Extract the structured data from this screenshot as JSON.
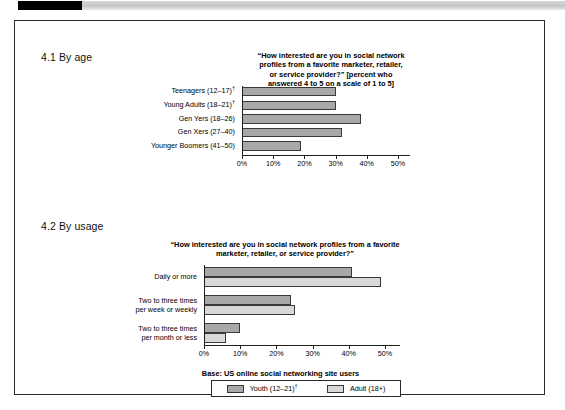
{
  "document": {
    "frame_border_color": "#2a2a2a",
    "tab_color": "#000000"
  },
  "sections": [
    {
      "id": "by-age",
      "heading": "4.1 By age"
    },
    {
      "id": "by-usage",
      "heading": "4.2 By usage"
    }
  ],
  "base_note": "Base: US online social networking site users",
  "legend": {
    "items": [
      {
        "label": "Youth (12–21)",
        "dagger": true,
        "color": "#a8a8a8"
      },
      {
        "label": "Adult (18+)",
        "dagger": false,
        "color": "#d8d8d8"
      }
    ]
  },
  "chart_data": [
    {
      "type": "bar",
      "orientation": "horizontal",
      "id": "by-age",
      "title": "“How interested are you in social network profiles from a favorite marketer, retailer, or service provider?” [percent who answered 4 to 5 on a scale of 1 to 5]",
      "title_lines": [
        "“How interested are you in social network",
        "profiles from a favorite marketer, retailer,",
        "or service provider?” [percent who",
        "answered 4 to 5 on a scale of 1 to 5]"
      ],
      "categories": [
        "Teenagers (12–17)",
        "Young Adults (18–21)",
        "Gen Yers (18–26)",
        "Gen Xers (27–40)",
        "Younger Boomers (41–50)"
      ],
      "category_daggers": [
        true,
        true,
        false,
        false,
        false
      ],
      "values": [
        30,
        30,
        38,
        32,
        19
      ],
      "series_colors": [
        "#a8a8a8",
        "#a8a8a8",
        "#a8a8a8",
        "#a8a8a8",
        "#a8a8a8"
      ],
      "xlabel": "",
      "ylabel": "",
      "xlim": [
        0,
        50
      ],
      "xticks": [
        0,
        10,
        20,
        30,
        40,
        50
      ],
      "xtick_labels": [
        "0%",
        "10%",
        "20%",
        "30%",
        "40%",
        "50%"
      ],
      "grid": false,
      "legend_position": "none"
    },
    {
      "type": "bar",
      "orientation": "horizontal",
      "id": "by-usage",
      "title": "“How interested are you in social network profiles from a favorite marketer, retailer, or service provider?”",
      "title_lines": [
        "“How interested are you in social network profiles from a favorite",
        "marketer, retailer, or service provider?”"
      ],
      "categories": [
        "Daily or more",
        "Two to three times per week or weekly",
        "Two to three times per month or less"
      ],
      "category_lines": [
        [
          "Daily or more"
        ],
        [
          "Two to three times",
          "per week or weekly"
        ],
        [
          "Two to three times",
          "per month or less"
        ]
      ],
      "series": [
        {
          "name": "Youth (12–21)",
          "color": "#a8a8a8",
          "values": [
            41,
            24,
            10
          ]
        },
        {
          "name": "Adult (18+)",
          "color": "#d8d8d8",
          "values": [
            49,
            25,
            6
          ]
        }
      ],
      "xlabel": "",
      "ylabel": "",
      "xlim": [
        0,
        50
      ],
      "xticks": [
        0,
        10,
        20,
        30,
        40,
        50
      ],
      "xtick_labels": [
        "0%",
        "10%",
        "20%",
        "30%",
        "40%",
        "50%"
      ],
      "grid": false,
      "legend_position": "bottom"
    }
  ]
}
